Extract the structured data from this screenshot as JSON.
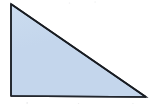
{
  "figure": {
    "shape_name": "triangle",
    "canvas": {
      "width": 151,
      "height": 104,
      "background_color": "#ffffff"
    },
    "style": {
      "fill_color": "#c4d6ec",
      "fill_color_light": "#cbdcef",
      "stroke_color": "#1e2229",
      "stroke_width": 1.6
    },
    "vertices": [
      {
        "name": "top-left-vertex",
        "x": 11,
        "y": 4,
        "label": ""
      },
      {
        "name": "bottom-left-vertex",
        "x": 11,
        "y": 96,
        "label": ""
      },
      {
        "name": "bottom-right-vertex",
        "x": 146,
        "y": 97,
        "label": ""
      }
    ],
    "edges": [
      {
        "name": "vertical-leg",
        "from": "top-left-vertex",
        "to": "bottom-left-vertex"
      },
      {
        "name": "horizontal-leg",
        "from": "bottom-left-vertex",
        "to": "bottom-right-vertex"
      },
      {
        "name": "hypotenuse",
        "from": "top-left-vertex",
        "to": "bottom-right-vertex"
      }
    ],
    "annotations": []
  }
}
